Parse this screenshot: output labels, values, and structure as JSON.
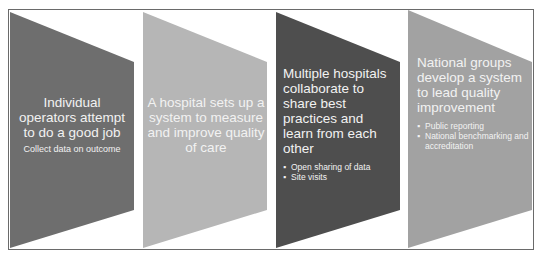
{
  "colors": {
    "step1": "#6e6e6e",
    "step2": "#b6b6b6",
    "step3": "#4e4e4e",
    "step4": "#a2a2a2",
    "text": "#f2f2f2",
    "frame_border": "#6a6a6a"
  },
  "steps": [
    {
      "title": "Individual operators attempt to do a good job",
      "subtext": "Collect data on outcome",
      "bullets": []
    },
    {
      "title": "A hospital sets up a system to measure and improve quality of care",
      "subtext": "",
      "bullets": []
    },
    {
      "title": "Multiple hospitals collaborate to share best practices and learn from each other",
      "subtext": "",
      "bullets": [
        "Open sharing of data",
        "Site visits"
      ]
    },
    {
      "title": "National groups develop a system to lead quality improvement",
      "subtext": "",
      "bullets": [
        "Public reporting",
        "National benchmarking and accreditation"
      ]
    }
  ]
}
